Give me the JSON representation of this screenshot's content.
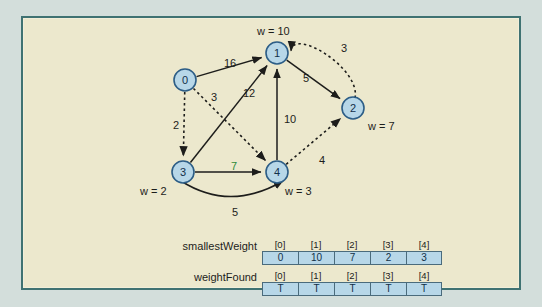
{
  "figure": {
    "background_color": "#ece8cd",
    "frame_color": "#3f7272",
    "node_fill": "#b7d7e8",
    "node_stroke": "#2c5d86",
    "highlight_color": "#2e8b3a"
  },
  "graph": {
    "nodes": [
      {
        "id": "0",
        "label": "0",
        "x": 185,
        "y": 80,
        "weight_label": "",
        "wx": 0,
        "wy": 0
      },
      {
        "id": "1",
        "label": "1",
        "x": 277,
        "y": 53,
        "weight_label": "w = 10",
        "wx": 257,
        "wy": 26
      },
      {
        "id": "2",
        "label": "2",
        "x": 353,
        "y": 108,
        "weight_label": "w = 7",
        "wx": 368,
        "wy": 121
      },
      {
        "id": "3",
        "label": "3",
        "x": 183,
        "y": 172,
        "weight_label": "w = 2",
        "wx": 140,
        "wy": 186
      },
      {
        "id": "4",
        "label": "4",
        "x": 277,
        "y": 172,
        "weight_label": "w = 3",
        "wx": 285,
        "wy": 186
      }
    ],
    "edges": [
      {
        "from": "0",
        "to": "1",
        "weight": "16",
        "style": "solid",
        "lx": 224,
        "ly": 58,
        "color": "#1d1d1b"
      },
      {
        "from": "0",
        "to": "3",
        "weight": "2",
        "style": "dashed",
        "lx": 173,
        "ly": 120,
        "color": "#1d1d1b"
      },
      {
        "from": "0",
        "to": "4",
        "weight": "3",
        "style": "dashed",
        "lx": 211,
        "ly": 92,
        "color": "#1d1d1b"
      },
      {
        "from": "3",
        "to": "1",
        "weight": "12",
        "style": "solid",
        "lx": 243,
        "ly": 88,
        "color": "#1d1d1b"
      },
      {
        "from": "3",
        "to": "4",
        "weight": "7",
        "style": "solid",
        "lx": 231,
        "ly": 161,
        "color": "#2e8b3a"
      },
      {
        "from": "4",
        "to": "1",
        "weight": "10",
        "style": "solid",
        "lx": 284,
        "ly": 114,
        "color": "#1d1d1b"
      },
      {
        "from": "4",
        "to": "3",
        "weight": "5",
        "style": "curve",
        "lx": 232,
        "ly": 207,
        "color": "#1d1d1b"
      },
      {
        "from": "4",
        "to": "2",
        "weight": "4",
        "style": "dashed",
        "lx": 319,
        "ly": 155,
        "color": "#1d1d1b"
      },
      {
        "from": "1",
        "to": "2",
        "weight": "5",
        "style": "solid",
        "lx": 303,
        "ly": 73,
        "color": "#1d1d1b"
      },
      {
        "from": "2",
        "to": "1",
        "weight": "3",
        "style": "dashcurve",
        "lx": 341,
        "ly": 43,
        "color": "#1d1d1b"
      }
    ]
  },
  "arrays": [
    {
      "name": "smallestWeight",
      "indices": [
        "[0]",
        "[1]",
        "[2]",
        "[3]",
        "[4]"
      ],
      "values": [
        "0",
        "10",
        "7",
        "2",
        "3"
      ]
    },
    {
      "name": "weightFound",
      "indices": [
        "[0]",
        "[1]",
        "[2]",
        "[3]",
        "[4]"
      ],
      "values": [
        "T",
        "T",
        "T",
        "T",
        "T"
      ]
    }
  ]
}
